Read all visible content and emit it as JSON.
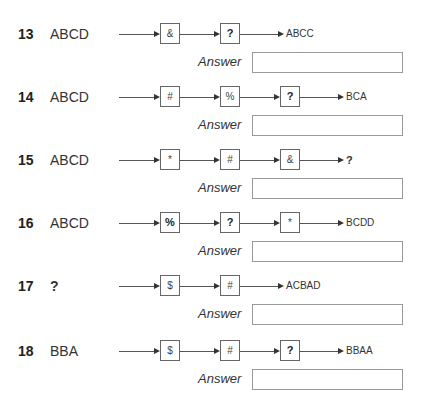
{
  "answer_label": "Answer",
  "questions": [
    {
      "number": "13",
      "input": "ABCD",
      "boxes": [
        "&",
        "?"
      ],
      "output": "ABCC",
      "answer": ""
    },
    {
      "number": "14",
      "input": "ABCD",
      "boxes": [
        "#",
        "%",
        "?"
      ],
      "output": "BCA",
      "answer": ""
    },
    {
      "number": "15",
      "input": "ABCD",
      "boxes": [
        "*",
        "#",
        "&"
      ],
      "output": "?",
      "answer": ""
    },
    {
      "number": "16",
      "input": "ABCD",
      "boxes": [
        "%",
        "?",
        "*"
      ],
      "output": "BCDD",
      "answer": ""
    },
    {
      "number": "17",
      "input": "?",
      "boxes": [
        "$",
        "#"
      ],
      "output": "ACBAD",
      "answer": ""
    },
    {
      "number": "18",
      "input": "BBA",
      "boxes": [
        "$",
        "#",
        "?"
      ],
      "output": "BBAA",
      "answer": ""
    }
  ]
}
